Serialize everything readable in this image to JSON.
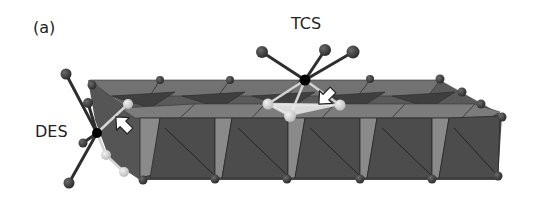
{
  "figure": {
    "panel_label": "(a)",
    "site_labels": {
      "des": "DES",
      "tcs": "TCS"
    },
    "colors": {
      "background": "#ffffff",
      "octahedron_dark": "#4a4a4a",
      "octahedron_mid": "#6e6e6e",
      "octahedron_light": "#8a8a8a",
      "vertex_atom": "#3d3d3d",
      "adsorbate_center": "#000000",
      "adsorbate_ligand_dark": "#333333",
      "adsorbate_ligand_light": "#d4d4d4",
      "arrow_fill": "#ffffff",
      "text": "#222222"
    },
    "icons": [
      "arrow-des-icon",
      "arrow-tcs-icon"
    ]
  }
}
